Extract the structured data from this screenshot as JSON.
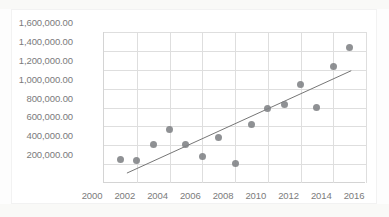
{
  "chart_data": {
    "type": "scatter",
    "title": "",
    "subtitle": "",
    "xlabel": "",
    "ylabel": "",
    "xlim": [
      2000,
      2016
    ],
    "ylim": [
      0,
      1600000
    ],
    "grid": true,
    "legend": false,
    "legend_position": "none",
    "x_tick_labels": [
      "2000",
      "2002",
      "2004",
      "2006",
      "2008",
      "2010",
      "2012",
      "2014",
      "2016"
    ],
    "x_tick_values": [
      2000,
      2002,
      2004,
      2006,
      2008,
      2010,
      2012,
      2014,
      2016
    ],
    "y_tick_labels": [
      "200,000.00",
      "400,000.00",
      "600,000.00",
      "800,000.00",
      "1,000,000.00",
      "1,200,000.00",
      "1,400,000.00",
      "1,600,000.00"
    ],
    "y_tick_values": [
      200000,
      400000,
      600000,
      800000,
      1000000,
      1200000,
      1400000,
      1600000
    ],
    "series": [
      {
        "name": "Series 1",
        "marker": "circle",
        "color": "#808285",
        "x": [
          2001,
          2002,
          2003,
          2004,
          2005,
          2006,
          2007,
          2008,
          2009,
          2010,
          2011,
          2012,
          2013,
          2014,
          2015
        ],
        "y": [
          250000,
          235000,
          405000,
          565000,
          405000,
          285000,
          480000,
          210000,
          615000,
          790000,
          830000,
          1045000,
          805000,
          1230000,
          1440000
        ]
      }
    ],
    "trendline": {
      "type": "linear",
      "color": "#767676",
      "x_start": 2001.4,
      "y_start": 105000,
      "x_end": 2015.1,
      "y_end": 1190000
    }
  },
  "colors": {
    "marker": "#808285",
    "trendline": "#767676",
    "grid": "#dedede",
    "axis": "#d4d4d4",
    "tick_text": "#7b7b7b",
    "background": "#ffffff"
  }
}
